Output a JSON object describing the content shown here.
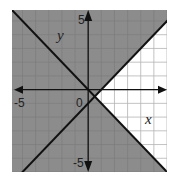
{
  "chart_data": {
    "type": "line",
    "title": "",
    "xlabel": "x",
    "ylabel": "y",
    "xlim": [
      -5.8,
      6.0
    ],
    "ylim": [
      -6.0,
      5.8
    ],
    "grid": true,
    "grid_step": 1,
    "tick_labels": {
      "x_negative": "-5",
      "origin": "0",
      "y_positive": "5",
      "y_negative": "-5"
    },
    "series": [
      {
        "name": "boundary line 1",
        "equation": "y = -x",
        "slope": -1,
        "intercept": 0,
        "style": "solid"
      },
      {
        "name": "boundary line 2",
        "equation": "y = x - 1",
        "slope": 1,
        "intercept": -1,
        "style": "solid"
      }
    ],
    "intersection": {
      "x": 0.5,
      "y": -0.5
    },
    "shading": {
      "description": "Everything shaded gray except the right-side wedge bounded by the two lines",
      "unshaded_region": "y > -x and y < x - 1",
      "shade_color": "#8c8c8c"
    }
  },
  "colors": {
    "background": "#ffffff",
    "shade": "#8c8c8c",
    "grid": "#b4b4b4",
    "grid_on_shade": "#7a7a7a",
    "lines": "#111111"
  },
  "labels": {
    "x_axis": "x",
    "y_axis": "y",
    "x_neg_tick": "-5",
    "origin": "0",
    "y_pos_tick": "5",
    "y_neg_tick": "-5"
  }
}
